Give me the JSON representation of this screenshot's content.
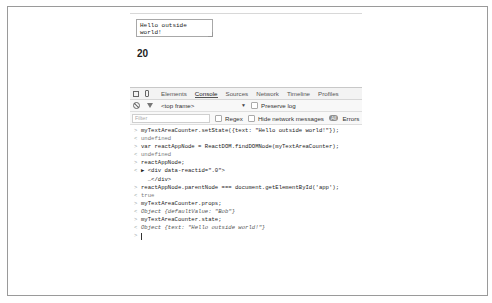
{
  "page": {
    "textarea_value": "Hello outside world!",
    "counter": "20"
  },
  "devtools": {
    "icons": [
      "inspect-icon",
      "device-mode-icon"
    ],
    "tabs": [
      {
        "label": "Elements",
        "active": false
      },
      {
        "label": "Console",
        "active": true
      },
      {
        "label": "Sources",
        "active": false
      },
      {
        "label": "Network",
        "active": false
      },
      {
        "label": "Timeline",
        "active": false
      },
      {
        "label": "Profiles",
        "active": false
      }
    ],
    "toolbar": {
      "frame_select": "<top frame>",
      "frame_caret": "▼",
      "preserve_log_label": "Preserve log"
    },
    "filterbar": {
      "filter_placeholder": "Filter",
      "regex_label": "Regex",
      "hide_network_label": "Hide network messages",
      "all_label": "All",
      "errors_label": "Errors"
    },
    "console_lines": [
      {
        "kind": "input",
        "prompt": ">",
        "text": "myTextAreaCounter.setState({text: \"Hello outside world!\"});"
      },
      {
        "kind": "output",
        "prompt": "<",
        "text": "undefined"
      },
      {
        "kind": "input",
        "prompt": ">",
        "text": "var reactAppNode = ReactDOM.findDOMNode(myTextAreaCounter);"
      },
      {
        "kind": "output",
        "prompt": "<",
        "text": "undefined"
      },
      {
        "kind": "input",
        "prompt": ">",
        "text": "reactAppNode;"
      },
      {
        "kind": "output",
        "prompt": "<",
        "text": "▶ <div data-reactid=\".0\">"
      },
      {
        "kind": "output",
        "prompt": "",
        "text": "  …</div>"
      },
      {
        "kind": "input",
        "prompt": ">",
        "text": "reactAppNode.parentNode === document.getElementById('app');"
      },
      {
        "kind": "output",
        "prompt": "<",
        "text": "true"
      },
      {
        "kind": "input",
        "prompt": ">",
        "text": "myTextAreaCounter.props;"
      },
      {
        "kind": "obj",
        "prompt": "<",
        "text": "Object {defaultValue: \"Bob\"}"
      },
      {
        "kind": "input",
        "prompt": ">",
        "text": "myTextAreaCounter.state;"
      },
      {
        "kind": "obj",
        "prompt": "<",
        "text": "Object {text: \"Hello outside world!\"}"
      }
    ],
    "prompt_symbol": ">"
  }
}
